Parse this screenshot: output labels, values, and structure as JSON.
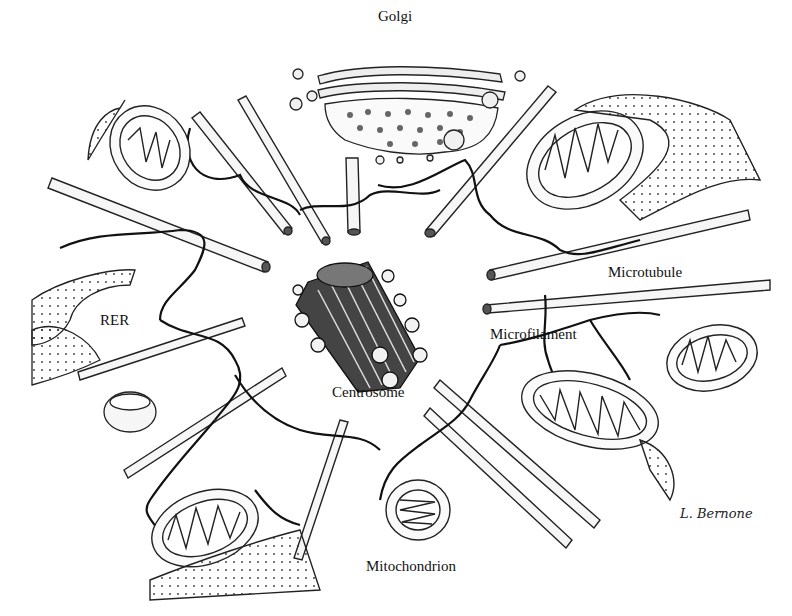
{
  "diagram": {
    "type": "cell cytoskeleton illustration",
    "labels": {
      "golgi": "Golgi",
      "microtubule": "Microtubule",
      "rer": "RER",
      "microfilament": "Microfilament",
      "centrosome": "Centrosome",
      "mitochondrion": "Mitochondrion"
    },
    "signature": "L. Bernone",
    "colors": {
      "ink": "#111111",
      "background": "#ffffff",
      "fill": "#f4f4f4"
    }
  }
}
